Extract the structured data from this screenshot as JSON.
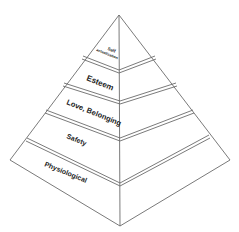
{
  "diagram": {
    "title": "",
    "type": "pyramid",
    "tiers": [
      {
        "label_line1": "Self",
        "label_line2": "actualization"
      },
      {
        "label": "Esteem"
      },
      {
        "label": "Love, Belonging"
      },
      {
        "label": "Safety"
      },
      {
        "label": "Physiological"
      }
    ],
    "colors": {
      "fill": "#ffffff",
      "stroke": "#6b6b6b",
      "text": "#222222"
    }
  }
}
